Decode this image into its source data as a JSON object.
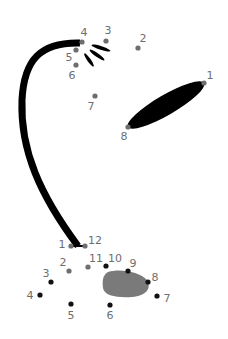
{
  "colors": {
    "background": "#ffffff",
    "ink": "#000000",
    "dot_gray": "#6e6e6e",
    "dot_black": "#111111",
    "label": "#6e6e6e",
    "stone": "#7a7a7a"
  },
  "top_dots": [
    {
      "n": "1",
      "x": 204,
      "y": 83,
      "lx": 210,
      "ly": 79,
      "color": "gray"
    },
    {
      "n": "2",
      "x": 138,
      "y": 48,
      "lx": 143,
      "ly": 42,
      "color": "gray"
    },
    {
      "n": "3",
      "x": 106,
      "y": 41,
      "lx": 108,
      "ly": 34,
      "color": "gray"
    },
    {
      "n": "4",
      "x": 82,
      "y": 42,
      "lx": 84,
      "ly": 36,
      "color": "gray"
    },
    {
      "n": "5",
      "x": 76,
      "y": 50,
      "lx": 69,
      "ly": 61,
      "color": "gray"
    },
    {
      "n": "6",
      "x": 76,
      "y": 65,
      "lx": 72,
      "ly": 79,
      "color": "gray"
    },
    {
      "n": "7",
      "x": 95,
      "y": 96,
      "lx": 91,
      "ly": 110,
      "color": "gray"
    },
    {
      "n": "8",
      "x": 128,
      "y": 127,
      "lx": 124,
      "ly": 140,
      "color": "gray"
    }
  ],
  "bottom_dots": [
    {
      "n": "1",
      "x": 71,
      "y": 246,
      "lx": 62,
      "ly": 248,
      "color": "gray"
    },
    {
      "n": "2",
      "x": 69,
      "y": 271,
      "lx": 63,
      "ly": 266,
      "color": "gray"
    },
    {
      "n": "3",
      "x": 51,
      "y": 282,
      "lx": 46,
      "ly": 277,
      "color": "black"
    },
    {
      "n": "4",
      "x": 40,
      "y": 295,
      "lx": 30,
      "ly": 299,
      "color": "black"
    },
    {
      "n": "5",
      "x": 71,
      "y": 304,
      "lx": 71,
      "ly": 319,
      "color": "black"
    },
    {
      "n": "6",
      "x": 110,
      "y": 305,
      "lx": 110,
      "ly": 319,
      "color": "black"
    },
    {
      "n": "7",
      "x": 157,
      "y": 296,
      "lx": 167,
      "ly": 302,
      "color": "black"
    },
    {
      "n": "8",
      "x": 148,
      "y": 282,
      "lx": 155,
      "ly": 281,
      "color": "black"
    },
    {
      "n": "9",
      "x": 128,
      "y": 271,
      "lx": 133,
      "ly": 267,
      "color": "black"
    },
    {
      "n": "10",
      "x": 106,
      "y": 266,
      "lx": 115,
      "ly": 262,
      "color": "black"
    },
    {
      "n": "11",
      "x": 88,
      "y": 267,
      "lx": 96,
      "ly": 262,
      "color": "gray"
    },
    {
      "n": "12",
      "x": 85,
      "y": 246,
      "lx": 95,
      "ly": 244,
      "color": "gray"
    }
  ]
}
